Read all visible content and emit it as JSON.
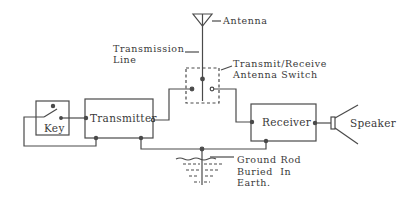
{
  "diagram": {
    "type": "radio-station-block-diagram",
    "colors": {
      "line": "#4a4a4a",
      "text": "#3a3a3a",
      "background": "#ffffff"
    },
    "labels": {
      "antenna": "Antenna",
      "transmission_line_1": "Transmission",
      "transmission_line_2": "Line",
      "switch_1": "Transmit/Receive",
      "switch_2": "Antenna Switch",
      "ground_1": "Ground Rod",
      "ground_2": "Buried  In",
      "ground_3": "Earth."
    },
    "blocks": {
      "key": "Key",
      "transmitter": "Transmitter",
      "receiver": "Receiver",
      "speaker": "Speaker"
    },
    "components": [
      {
        "id": "antenna",
        "label": "Antenna"
      },
      {
        "id": "transmission-line",
        "label": "Transmission Line"
      },
      {
        "id": "antenna-switch",
        "label": "Transmit/Receive Antenna Switch"
      },
      {
        "id": "key",
        "label": "Key"
      },
      {
        "id": "transmitter",
        "label": "Transmitter"
      },
      {
        "id": "receiver",
        "label": "Receiver"
      },
      {
        "id": "speaker",
        "label": "Speaker"
      },
      {
        "id": "ground-rod",
        "label": "Ground Rod Buried In Earth."
      }
    ],
    "connections": [
      [
        "antenna",
        "antenna-switch"
      ],
      [
        "antenna-switch",
        "transmitter"
      ],
      [
        "antenna-switch",
        "receiver"
      ],
      [
        "key",
        "transmitter"
      ],
      [
        "receiver",
        "speaker"
      ],
      [
        "transmitter",
        "ground-rod"
      ],
      [
        "receiver",
        "ground-rod"
      ]
    ]
  }
}
